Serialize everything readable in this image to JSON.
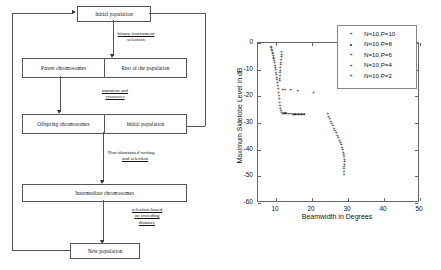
{
  "flowchart": {
    "title": "NSGA-II evolutionary loop",
    "nodes": {
      "initial_population_top": "Initial population",
      "parent_chromosomes": "Parent chromosomes",
      "rest_of_population": "Rest of the population",
      "offspring_chromosomes": "Offspring chromosomes",
      "initial_population_inner": "Initial population",
      "intermediate_chromosomes": "Intermediate chromosomes",
      "new_population": "New population"
    },
    "edge_labels": {
      "binary_tournament": [
        "binary tournament",
        "selection"
      ],
      "mutation_crossover": [
        "mutation and",
        "crossover"
      ],
      "non_dominated": [
        "Non-dominated sorting",
        "and selection"
      ],
      "crowding": [
        "selection based",
        "on crowding",
        "distance"
      ]
    }
  },
  "chart_data": {
    "type": "scatter",
    "title": "",
    "xlabel": "Beamwidth in Degrees",
    "ylabel": "Maximum Sidelobe Level in dB",
    "xlim": [
      5,
      50
    ],
    "ylim": [
      -60,
      0
    ],
    "xticks": [
      10,
      20,
      30,
      40,
      50
    ],
    "yticks": [
      0,
      -10,
      -20,
      -30,
      -40,
      -50,
      -60
    ],
    "grid": false,
    "legend_position": "upper right",
    "series": [
      {
        "name": "N=10,P=10",
        "marker": "+",
        "points": [
          [
            8.6,
            -1.2
          ],
          [
            8.7,
            -1.6
          ],
          [
            8.8,
            -2.1
          ],
          [
            8.9,
            -2.6
          ],
          [
            9.0,
            -3.2
          ],
          [
            9.1,
            -3.8
          ],
          [
            9.2,
            -4.4
          ],
          [
            9.3,
            -5.1
          ],
          [
            9.4,
            -5.8
          ],
          [
            9.5,
            -6.5
          ],
          [
            9.6,
            -7.3
          ],
          [
            9.7,
            -8.1
          ],
          [
            9.8,
            -8.9
          ],
          [
            9.9,
            -9.8
          ],
          [
            10.0,
            -10.7
          ],
          [
            10.1,
            -11.6
          ],
          [
            10.2,
            -12.6
          ],
          [
            10.3,
            -13.6
          ],
          [
            10.4,
            -14.7
          ],
          [
            10.5,
            -15.8
          ],
          [
            10.6,
            -17.0
          ],
          [
            10.7,
            -18.2
          ],
          [
            10.8,
            -19.5
          ],
          [
            10.9,
            -20.8
          ],
          [
            11.0,
            -22.0
          ],
          [
            11.1,
            -23.2
          ],
          [
            11.2,
            -24.2
          ],
          [
            11.4,
            -25.1
          ],
          [
            11.6,
            -25.7
          ],
          [
            11.9,
            -26.1
          ]
        ]
      },
      {
        "name": "N=10,P=8",
        "marker": "dot",
        "points": [
          [
            12.2,
            -26.3
          ],
          [
            12.6,
            -26.4
          ],
          [
            13.0,
            -26.4
          ],
          [
            13.4,
            -26.5
          ],
          [
            13.8,
            -26.5
          ],
          [
            14.2,
            -26.5
          ],
          [
            14.6,
            -26.6
          ],
          [
            15.0,
            -26.6
          ],
          [
            15.4,
            -26.6
          ],
          [
            15.8,
            -26.6
          ],
          [
            16.2,
            -26.7
          ],
          [
            16.6,
            -26.7
          ],
          [
            17.0,
            -26.7
          ],
          [
            17.4,
            -26.7
          ],
          [
            17.8,
            -26.8
          ]
        ]
      },
      {
        "name": "N=10,P=6",
        "marker": "+",
        "points": [
          [
            11.5,
            -3.0
          ],
          [
            11.6,
            -4.0
          ],
          [
            11.5,
            -5.0
          ],
          [
            11.4,
            -6.0
          ],
          [
            11.3,
            -7.0
          ],
          [
            11.3,
            -8.0
          ],
          [
            11.2,
            -9.0
          ],
          [
            11.2,
            -10.0
          ],
          [
            11.1,
            -11.0
          ],
          [
            11.1,
            -12.0
          ],
          [
            11.0,
            -13.0
          ],
          [
            11.0,
            -14.0
          ]
        ]
      },
      {
        "name": "N=10,P=4",
        "marker": "+",
        "points": [
          [
            11.9,
            -17.2
          ],
          [
            12.5,
            -17.2
          ],
          [
            14.1,
            -17.3
          ],
          [
            16.0,
            -17.5
          ],
          [
            20.4,
            -18.5
          ]
        ]
      },
      {
        "name": "N=10,P=2",
        "marker": "+",
        "points": [
          [
            24.4,
            -26.4
          ],
          [
            24.6,
            -27.3
          ],
          [
            24.9,
            -28.2
          ],
          [
            25.2,
            -29.1
          ],
          [
            25.5,
            -30.0
          ],
          [
            25.8,
            -30.9
          ],
          [
            26.1,
            -31.7
          ],
          [
            26.4,
            -32.6
          ],
          [
            26.7,
            -33.5
          ],
          [
            27.0,
            -34.4
          ],
          [
            27.3,
            -35.3
          ],
          [
            27.6,
            -36.2
          ],
          [
            27.9,
            -37.1
          ],
          [
            28.1,
            -38.0
          ],
          [
            28.3,
            -38.9
          ],
          [
            28.5,
            -39.8
          ],
          [
            28.7,
            -40.7
          ],
          [
            28.8,
            -41.6
          ],
          [
            28.9,
            -42.5
          ],
          [
            29.0,
            -43.4
          ],
          [
            29.0,
            -44.3
          ],
          [
            29.0,
            -45.2
          ],
          [
            28.9,
            -46.1
          ],
          [
            28.9,
            -47.0
          ],
          [
            28.9,
            -48.0
          ],
          [
            28.9,
            -49.0
          ]
        ]
      }
    ]
  }
}
